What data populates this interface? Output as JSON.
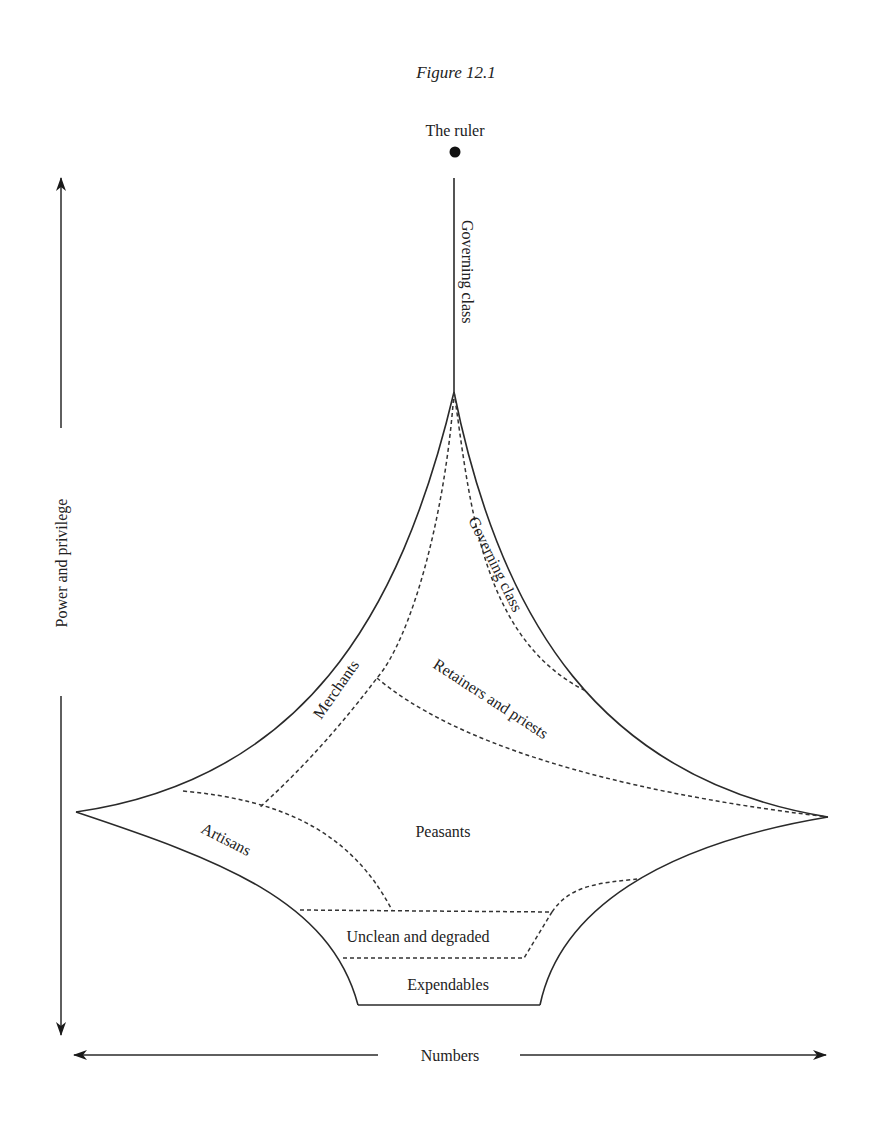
{
  "figure": {
    "title": "Figure 12.1",
    "apex_label": "The ruler",
    "axes": {
      "vertical_label": "Power and privilege",
      "horizontal_label": "Numbers"
    },
    "strata": [
      {
        "id": "governing-class-stem",
        "label": "Governing class"
      },
      {
        "id": "governing-class",
        "label": "Governing class"
      },
      {
        "id": "merchants",
        "label": "Merchants"
      },
      {
        "id": "retainers-priests",
        "label": "Retainers and priests"
      },
      {
        "id": "peasants",
        "label": "Peasants"
      },
      {
        "id": "artisans",
        "label": "Artisans"
      },
      {
        "id": "unclean-degraded",
        "label": "Unclean and degraded"
      },
      {
        "id": "expendables",
        "label": "Expendables"
      }
    ],
    "colors": {
      "line": "#2a2a2a",
      "background": "#ffffff"
    }
  }
}
